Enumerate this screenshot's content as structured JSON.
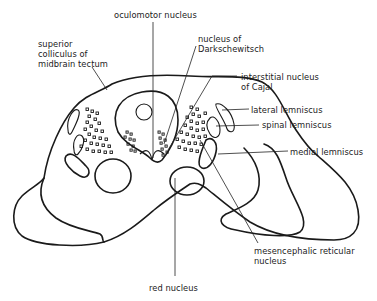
{
  "diagram": {
    "labels": [
      {
        "id": "oculomotor",
        "text": "oculomotor nucleus",
        "x": 146,
        "y": 10
      },
      {
        "id": "superior-colliculus",
        "text": "superior\ncolliculus of\nmidbrain tectum",
        "x": 38,
        "y": 39
      },
      {
        "id": "darkschewitsch",
        "text": "nucleus of\nDarkschewitsch",
        "x": 198,
        "y": 34
      },
      {
        "id": "interstitial-cajal",
        "text": "interstitial nucleus\nof Cajal",
        "x": 241,
        "y": 72
      },
      {
        "id": "lateral-lemniscus",
        "text": "lateral lemniscus",
        "x": 251,
        "y": 105
      },
      {
        "id": "spinal-lemniscus",
        "text": "spinal lemniscus",
        "x": 262,
        "y": 120
      },
      {
        "id": "medial-lemniscus",
        "text": "medial lemniscus",
        "x": 290,
        "y": 147
      },
      {
        "id": "mesencephalic-reticular",
        "text": "mesencephalic reticular\nnucleus",
        "x": 254,
        "y": 246
      },
      {
        "id": "red-nucleus",
        "text": "red nucleus",
        "x": 149,
        "y": 283
      }
    ]
  }
}
